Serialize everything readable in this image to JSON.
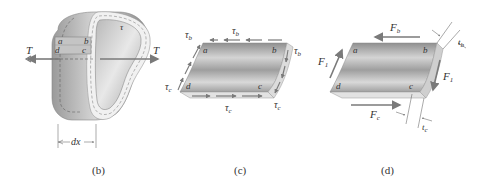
{
  "figure": {
    "colors": {
      "arrow": "#7a7a7a",
      "surface_dark": "#8c8c8c",
      "surface_light": "#d9d9d9",
      "edge": "#c8c8c8",
      "text": "#333333"
    }
  },
  "panel_b": {
    "caption": "(b)",
    "torque_left": "T",
    "torque_right": "T",
    "shear_label": "τ",
    "corners": {
      "a": "a",
      "b": "b",
      "c": "c",
      "d": "d"
    },
    "dimension": "dx"
  },
  "panel_c": {
    "caption": "(c)",
    "tau_b_top": "τ",
    "tau_b_top_sub": "b",
    "tau_b_left": "τ",
    "tau_b_left_sub": "b",
    "tau_b_right": "τ",
    "tau_b_right_sub": "b",
    "tau_c_left": "τ",
    "tau_c_left_sub": "c",
    "tau_c_bottom": "τ",
    "tau_c_bottom_sub": "c",
    "tau_c_right": "τ",
    "tau_c_right_sub": "c",
    "corners": {
      "a": "a",
      "b": "b",
      "c": "c",
      "d": "d"
    }
  },
  "panel_d": {
    "caption": "(d)",
    "force_top": "F",
    "force_top_sub": "b",
    "force_left": "F",
    "force_left_sub": "1",
    "force_right": "F",
    "force_right_sub": "1",
    "force_bottom": "F",
    "force_bottom_sub": "c",
    "thickness_b": "t",
    "thickness_b_sub": "b",
    "thickness_c": "t",
    "thickness_c_sub": "c",
    "corners": {
      "a": "a",
      "b": "b",
      "c": "c",
      "d": "d"
    }
  }
}
